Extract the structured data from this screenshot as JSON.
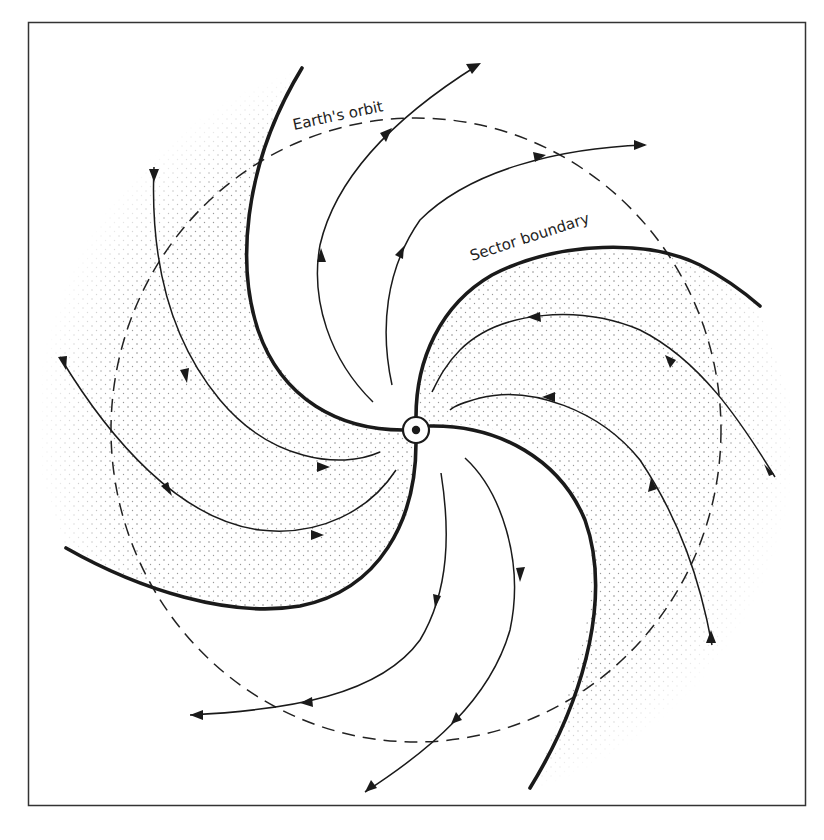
{
  "figure": {
    "labels": {
      "orbit": "Earth's orbit",
      "boundary": "Sector boundary"
    },
    "center_symbol": "sun-symbol",
    "colors": {
      "ink": "#1a1a1a",
      "background": "#ffffff",
      "stipple": "#8a8a8a"
    },
    "elements": {
      "sectors": 4,
      "sector_boundaries": 4,
      "field_lines": 12,
      "shaded_sectors": [
        "upper-left",
        "lower-right",
        "right",
        "left"
      ],
      "field_directions": {
        "upper-left-shaded": "inward",
        "top-unshaded": "outward",
        "right-shaded": "inward",
        "bottom-unshaded": "outward"
      }
    }
  }
}
